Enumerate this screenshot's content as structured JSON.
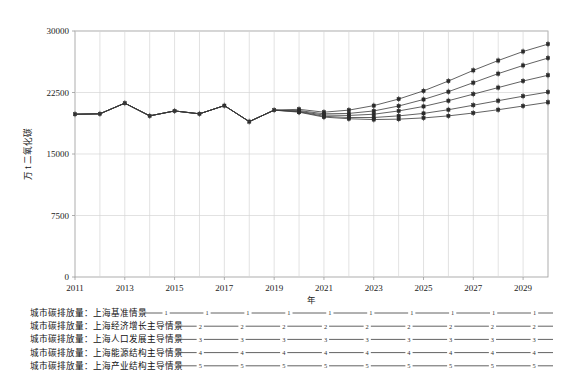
{
  "chart_data": {
    "type": "line",
    "title": "",
    "xlabel": "年",
    "ylabel": "万 t 二氧化碳",
    "xlim": [
      2011,
      2030
    ],
    "ylim": [
      0,
      30000
    ],
    "yticks": [
      0,
      7500,
      15000,
      22500,
      30000
    ],
    "xticks": [
      2011,
      2013,
      2015,
      2017,
      2019,
      2021,
      2023,
      2025,
      2027,
      2029
    ],
    "grid": true,
    "legend_position": "bottom",
    "x": [
      2011,
      2012,
      2013,
      2014,
      2015,
      2016,
      2017,
      2018,
      2019,
      2020,
      2021,
      2022,
      2023,
      2024,
      2025,
      2026,
      2027,
      2028,
      2029,
      2030
    ],
    "series": [
      {
        "name": "城市碳排放量：上海基准情景",
        "marker_label": "1",
        "values": [
          19850,
          19900,
          21200,
          19650,
          20250,
          19900,
          20900,
          18950,
          20350,
          20450,
          20100,
          20350,
          20900,
          21700,
          22700,
          23900,
          25200,
          26400,
          27500,
          28400
        ]
      },
      {
        "name": "城市碳排放量：上海经济增长主导情景",
        "marker_label": "2",
        "values": [
          19850,
          19900,
          21200,
          19650,
          20250,
          19900,
          20900,
          18950,
          20350,
          20300,
          19900,
          19950,
          20250,
          20850,
          21650,
          22600,
          23700,
          24800,
          25800,
          26700
        ]
      },
      {
        "name": "城市碳排放量：上海人口发展主导情景",
        "marker_label": "3",
        "values": [
          19850,
          19900,
          21200,
          19650,
          20250,
          19900,
          20900,
          18950,
          20350,
          20200,
          19750,
          19700,
          19850,
          20250,
          20800,
          21500,
          22300,
          23100,
          23900,
          24600
        ]
      },
      {
        "name": "城市碳排放量：上海能源结构主导情景",
        "marker_label": "4",
        "values": [
          19850,
          19900,
          21200,
          19650,
          20250,
          19900,
          20900,
          18950,
          20350,
          20150,
          19600,
          19450,
          19450,
          19650,
          19950,
          20400,
          20950,
          21500,
          22050,
          22550
        ]
      },
      {
        "name": "城市碳排放量：上海产业结构主导情景",
        "marker_label": "5",
        "values": [
          19850,
          19900,
          21200,
          19650,
          20250,
          19900,
          20900,
          18950,
          20350,
          20100,
          19500,
          19300,
          19200,
          19250,
          19400,
          19650,
          20000,
          20400,
          20850,
          21300
        ]
      }
    ]
  },
  "legend": {
    "entries": [
      {
        "label": "城市碳排放量：上海基准情景",
        "marker": "1"
      },
      {
        "label": "城市碳排放量：上海经济增长主导情景",
        "marker": "2"
      },
      {
        "label": "城市碳排放量：上海人口发展主导情景",
        "marker": "3"
      },
      {
        "label": "城市碳排放量：上海能源结构主导情景",
        "marker": "4"
      },
      {
        "label": "城市碳排放量：上海产业结构主导情景",
        "marker": "5"
      }
    ]
  },
  "colors": {
    "line": "#3a3a3a",
    "grid": "#d6d6d6",
    "axis": "#9a9a9a",
    "text": "#111111",
    "background": "#ffffff"
  }
}
